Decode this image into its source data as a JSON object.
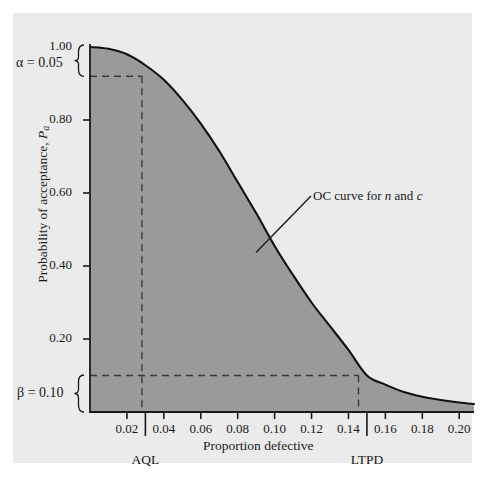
{
  "chart_data": {
    "type": "line",
    "title": "",
    "xlabel": "Proportion defective",
    "ylabel": "Probability of acceptance, Pa",
    "ylabel_main": "Probability of acceptance, ",
    "ylabel_symbol": "P",
    "ylabel_subscript": "a",
    "xlim": [
      0,
      0.208
    ],
    "ylim": [
      0,
      1.0
    ],
    "xticks": [
      0.02,
      0.04,
      0.06,
      0.08,
      0.1,
      0.12,
      0.14,
      0.16,
      0.18,
      0.2
    ],
    "xtick_labels": [
      "0.02",
      "0.04",
      "0.06",
      "0.08",
      "0.10",
      "0.12",
      "0.14",
      "0.16",
      "0.18",
      "0.20"
    ],
    "yticks": [
      0.2,
      0.4,
      0.6,
      0.8,
      1.0
    ],
    "ytick_labels": [
      "0.20",
      "0.40",
      "0.60",
      "0.80",
      "1.00"
    ],
    "grid": false,
    "legend": "none",
    "series": [
      {
        "name": "OC curve for n and c",
        "x": [
          0.0,
          0.01,
          0.02,
          0.03,
          0.04,
          0.05,
          0.06,
          0.07,
          0.08,
          0.09,
          0.1,
          0.11,
          0.12,
          0.13,
          0.14,
          0.15,
          0.16,
          0.17,
          0.18,
          0.19,
          0.2,
          0.208
        ],
        "y": [
          1.0,
          0.995,
          0.98,
          0.95,
          0.91,
          0.855,
          0.79,
          0.715,
          0.63,
          0.545,
          0.455,
          0.375,
          0.3,
          0.235,
          0.17,
          0.1,
          0.075,
          0.055,
          0.042,
          0.033,
          0.026,
          0.022
        ],
        "fill": "under",
        "fill_color": "#9a9a9a",
        "line_color": "#111111"
      }
    ],
    "annotations": [
      {
        "name": "oc-curve-callout",
        "text_plain": "OC curve for n and c",
        "text_prefix": "OC curve for ",
        "text_italic_1": "n",
        "text_middle": " and ",
        "text_italic_2": "c",
        "point": [
          0.0915,
          0.452
        ]
      },
      {
        "name": "alpha-brace",
        "text_prefix": "α",
        "text_value": " = 0.05",
        "from_y": 1.0,
        "to_y": 0.95
      },
      {
        "name": "beta-brace",
        "text_prefix": "β",
        "text_value": " = 0.10",
        "from_y": 0.1,
        "to_y": 0.0
      }
    ],
    "reference_lines": [
      {
        "name": "aql-line",
        "label": "AQL",
        "x": 0.03,
        "y": 0.95,
        "style": "dashed"
      },
      {
        "name": "ltpd-line",
        "label": "LTPD",
        "x": 0.15,
        "y": 0.1,
        "style": "dashed"
      }
    ],
    "axis_markers": [
      {
        "name": "aql-marker",
        "label": "AQL",
        "x": 0.03
      },
      {
        "name": "ltpd-marker",
        "label": "LTPD",
        "x": 0.15
      }
    ],
    "colors": {
      "page_background": "#ffffff",
      "panel_background": "#ebebeb",
      "fill": "#9a9a9a",
      "curve": "#111111",
      "axis": "#1a1a1a",
      "dashed": "#3a3a3a",
      "text": "#1a1a1a"
    }
  }
}
